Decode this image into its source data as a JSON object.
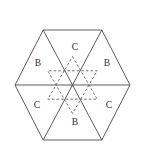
{
  "figure": {
    "background_color": "#ffffff",
    "solid_line_color": "#4a4a4a",
    "dashed_line_color": "#5a5a5a",
    "label_color": "#2e2e2e",
    "canvas": {
      "width": 144,
      "height": 157
    },
    "hexagon": {
      "center": {
        "x": 72.5,
        "y": 85
      },
      "circumradius": 57.5,
      "orientation": "pointy-left-right",
      "vertices": [
        {
          "name": "left",
          "x": 15,
          "y": 85
        },
        {
          "name": "top-left",
          "x": 43.2,
          "y": 30
        },
        {
          "name": "top-right",
          "x": 101.8,
          "y": 30
        },
        {
          "name": "right",
          "x": 130,
          "y": 85
        },
        {
          "name": "bottom-right",
          "x": 101.8,
          "y": 140
        },
        {
          "name": "bottom-left",
          "x": 43.2,
          "y": 140
        }
      ],
      "diagonals_through_center": 3,
      "sub_triangles": 6
    },
    "hexagram": {
      "style": "dashed",
      "circumradius": 28.5,
      "triangle_up": [
        {
          "x": 72.5,
          "y": 56.5
        },
        {
          "x": 97.2,
          "y": 99.2
        },
        {
          "x": 47.8,
          "y": 99.2
        }
      ],
      "triangle_down": [
        {
          "x": 72.5,
          "y": 113.5
        },
        {
          "x": 47.8,
          "y": 70.8
        },
        {
          "x": 97.2,
          "y": 70.8
        }
      ]
    },
    "labels": [
      {
        "id": "label-top",
        "text": "C",
        "x": 75,
        "y": 48
      },
      {
        "id": "label-upper-left",
        "text": "B",
        "x": 38,
        "y": 64
      },
      {
        "id": "label-upper-right",
        "text": "B",
        "x": 107,
        "y": 64
      },
      {
        "id": "label-lower-left",
        "text": "C",
        "x": 37,
        "y": 106
      },
      {
        "id": "label-lower-right",
        "text": "C",
        "x": 109,
        "y": 106
      },
      {
        "id": "label-bottom",
        "text": "B",
        "x": 75,
        "y": 123
      }
    ]
  }
}
